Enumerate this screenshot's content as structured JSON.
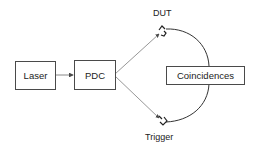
{
  "diagram": {
    "nodes": {
      "laser": "Laser",
      "pdc": "PDC",
      "coincidences": "Coincidences"
    },
    "detectors": {
      "top": "DUT",
      "bottom": "Trigger"
    },
    "edges": [
      {
        "from": "Laser",
        "to": "PDC"
      },
      {
        "from": "PDC",
        "to": "DUT"
      },
      {
        "from": "PDC",
        "to": "Trigger"
      },
      {
        "from": "DUT",
        "to": "Coincidences"
      },
      {
        "from": "Trigger",
        "to": "Coincidences"
      }
    ],
    "colors": {
      "stroke": "#4a4a4a",
      "text": "#222222",
      "background": "#ffffff"
    }
  }
}
